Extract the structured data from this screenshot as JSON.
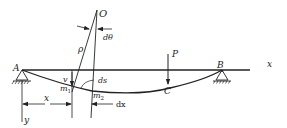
{
  "diagram": {
    "title": "",
    "labels": {
      "origin_center": "O",
      "d_theta": "dθ",
      "rho": "ρ",
      "point_A": "A",
      "point_B": "B",
      "point_C": "C",
      "load": "P",
      "x_axis": "x",
      "y_axis": "y",
      "v": "v",
      "ds": "ds",
      "m1": "m",
      "m1_sub": "1",
      "m2": "m",
      "m2_sub": "2",
      "x_dim": "x",
      "dx": "dx"
    },
    "colors": {
      "stroke": "#222222",
      "background": "#ffffff"
    }
  }
}
